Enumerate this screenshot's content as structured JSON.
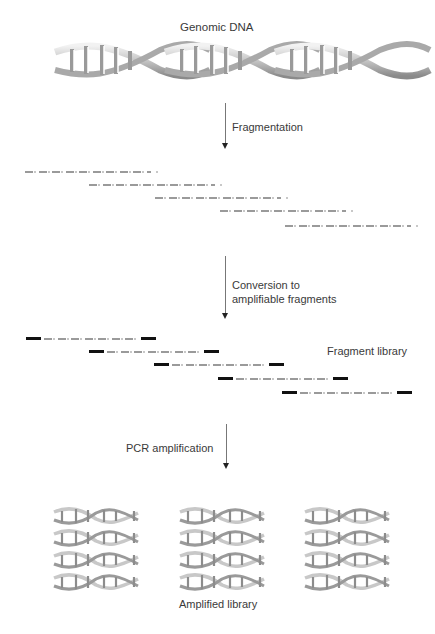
{
  "diagram": {
    "title_top": "Genomic DNA",
    "steps": [
      {
        "label": "Fragmentation"
      },
      {
        "label_line1": "Conversion to",
        "label_line2": "amplifiable fragments"
      },
      {
        "label": "PCR amplification"
      }
    ],
    "fragment_library_label": "Fragment library",
    "amplified_library_label": "Amplified library",
    "colors": {
      "dna_light": "#e8e8e8",
      "dna_mid": "#b0b0b0",
      "dna_dark": "#7a7a7a",
      "fragment_gray": "#9a9a9a",
      "adapter_black": "#111111",
      "arrow": "#777777"
    },
    "raw_fragments": [
      {
        "x": 25,
        "y": 171,
        "w": 126
      },
      {
        "x": 89,
        "y": 184,
        "w": 126
      },
      {
        "x": 155,
        "y": 197,
        "w": 126
      },
      {
        "x": 220,
        "y": 210,
        "w": 126
      },
      {
        "x": 285,
        "y": 225,
        "w": 126
      }
    ],
    "library_fragments": [
      {
        "x": 26,
        "y": 338,
        "w": 130
      },
      {
        "x": 89,
        "y": 351,
        "w": 130
      },
      {
        "x": 154,
        "y": 364,
        "w": 130
      },
      {
        "x": 218,
        "y": 378,
        "w": 130
      },
      {
        "x": 282,
        "y": 392,
        "w": 130
      }
    ],
    "amplified_copies": {
      "columns": 3,
      "rows": 4
    }
  }
}
